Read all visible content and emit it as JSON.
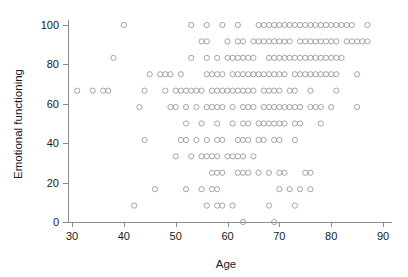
{
  "figure": {
    "width": 408,
    "height": 277,
    "background": "#ffffff",
    "marker_color": "#9a9a9a",
    "axis_color": "#8c8c8c",
    "text_color": "#1a1a1a"
  },
  "axes": {
    "x_title": "Age",
    "y_title": "Emotional functioning",
    "x_ticks": [
      "30",
      "40",
      "50",
      "60",
      "70",
      "80",
      "90"
    ],
    "y_ticks": [
      "0",
      "20",
      "40",
      "60",
      "80",
      "100"
    ]
  },
  "chart_data": {
    "type": "scatter",
    "title": "",
    "xlabel": "Age",
    "ylabel": "Emotional functioning",
    "xlim": [
      30,
      90
    ],
    "ylim": [
      0,
      100
    ],
    "xticks": [
      30,
      40,
      50,
      60,
      70,
      80,
      90
    ],
    "yticks": [
      0,
      20,
      40,
      60,
      80,
      100
    ],
    "grid": false,
    "legend": null,
    "marker": "open-circle",
    "marker_size": 4,
    "marker_color": "#9a9a9a",
    "note": "Each point is one patient; y values are quantized EORTC-style emotional functioning scores (multiples of 8.33) and x values are integer ages.",
    "y_levels": [
      0,
      8.33,
      16.67,
      25,
      33.33,
      41.67,
      50,
      58.33,
      66.67,
      75,
      83.33,
      91.67,
      100
    ],
    "rows": [
      {
        "y": 100,
        "x": [
          40,
          53,
          56,
          59,
          62,
          66,
          67,
          68,
          69,
          70,
          71,
          72,
          73,
          74,
          75,
          76,
          77,
          78,
          79,
          80,
          81,
          82,
          83,
          84,
          87
        ]
      },
      {
        "y": 91.67,
        "x": [
          55,
          56,
          60,
          62,
          63,
          65,
          66,
          67,
          68,
          69,
          70,
          71,
          72,
          74,
          75,
          76,
          77,
          78,
          79,
          80,
          81,
          83,
          84,
          85,
          86,
          87
        ]
      },
      {
        "y": 83.33,
        "x": [
          38,
          53,
          56,
          58,
          60,
          61,
          62,
          63,
          64,
          65,
          68,
          69,
          70,
          71,
          72,
          73,
          74,
          75,
          76,
          77,
          78,
          79,
          80,
          81,
          82
        ]
      },
      {
        "y": 75,
        "x": [
          45,
          47,
          48,
          49,
          51,
          56,
          57,
          58,
          59,
          61,
          62,
          63,
          64,
          65,
          66,
          67,
          68,
          69,
          70,
          71,
          73,
          74,
          75,
          76,
          77,
          78,
          79,
          80,
          81,
          85
        ]
      },
      {
        "y": 66.67,
        "x": [
          31,
          34,
          36,
          37,
          44,
          48,
          50,
          51,
          52,
          53,
          54,
          55,
          57,
          58,
          59,
          60,
          61,
          62,
          63,
          64,
          65,
          67,
          68,
          69,
          70,
          72,
          73,
          76,
          81
        ]
      },
      {
        "y": 58.33,
        "x": [
          43,
          49,
          50,
          52,
          54,
          56,
          57,
          58,
          59,
          61,
          63,
          64,
          65,
          67,
          68,
          69,
          70,
          71,
          72,
          73,
          74,
          76,
          77,
          78,
          80,
          85
        ]
      },
      {
        "y": 50,
        "x": [
          52,
          55,
          58,
          61,
          63,
          64,
          66,
          67,
          68,
          69,
          70,
          71,
          73,
          74,
          78
        ]
      },
      {
        "y": 41.67,
        "x": [
          44,
          51,
          52,
          54,
          56,
          58,
          59,
          62,
          63,
          64,
          66,
          67,
          69,
          70,
          73
        ]
      },
      {
        "y": 33.33,
        "x": [
          50,
          53,
          55,
          56,
          57,
          58,
          60,
          61,
          62,
          63,
          65
        ]
      },
      {
        "y": 25,
        "x": [
          57,
          58,
          59,
          62,
          63,
          64,
          66,
          68,
          70,
          71,
          75,
          76
        ]
      },
      {
        "y": 16.67,
        "x": [
          46,
          52,
          55,
          57,
          58,
          70,
          72,
          74,
          76
        ]
      },
      {
        "y": 8.33,
        "x": [
          42,
          56,
          58,
          59,
          61,
          68,
          73
        ]
      },
      {
        "y": 0,
        "x": [
          63,
          69
        ]
      }
    ]
  }
}
